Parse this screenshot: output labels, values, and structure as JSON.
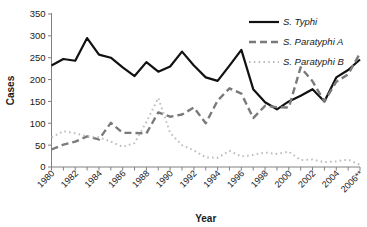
{
  "chart_data": {
    "type": "line",
    "title": "",
    "xlabel": "Year",
    "ylabel": "Cases",
    "ylim": [
      0,
      350
    ],
    "yticks": [
      0,
      50,
      100,
      150,
      200,
      250,
      300,
      350
    ],
    "grid": false,
    "legend_position": "top-right",
    "x": [
      "1980",
      "1981",
      "1982",
      "1983",
      "1984",
      "1985",
      "1986",
      "1987",
      "1988",
      "1989",
      "1990",
      "1991",
      "1992",
      "1993",
      "1994",
      "1995",
      "1996",
      "1997",
      "1998",
      "1999",
      "2000",
      "2001",
      "2002",
      "2003",
      "2004",
      "2005",
      "2006**"
    ],
    "xtick_labels": [
      "1980",
      "1982",
      "1984",
      "1986",
      "1988",
      "1990",
      "1992",
      "1994",
      "1996",
      "1998",
      "2000",
      "2002",
      "2004",
      "2006**"
    ],
    "series": [
      {
        "name": "S. Typhi",
        "style": "solid",
        "color": "#111111",
        "values": [
          232,
          247,
          243,
          295,
          257,
          250,
          228,
          208,
          240,
          218,
          230,
          264,
          232,
          205,
          197,
          232,
          268,
          178,
          148,
          132,
          150,
          163,
          178,
          150,
          205,
          222,
          246
        ]
      },
      {
        "name": "S. Paratyphi A",
        "style": "dashed",
        "color": "#7a7a7a",
        "values": [
          40,
          51,
          58,
          70,
          63,
          101,
          78,
          78,
          77,
          125,
          115,
          120,
          136,
          100,
          152,
          180,
          168,
          112,
          140,
          137,
          136,
          228,
          196,
          150,
          195,
          212,
          260
        ]
      },
      {
        "name": "S. Paratyphi B",
        "style": "dotted",
        "color": "#bdbdbd",
        "values": [
          68,
          82,
          77,
          70,
          68,
          58,
          46,
          55,
          103,
          158,
          78,
          50,
          38,
          22,
          21,
          37,
          24,
          28,
          33,
          30,
          35,
          16,
          17,
          11,
          13,
          17,
          5
        ]
      }
    ]
  },
  "legend": {
    "items": [
      {
        "label": "S. Typhi"
      },
      {
        "label": "S. Paratyphi A"
      },
      {
        "label": "S. Paratyphi B"
      }
    ]
  },
  "axes": {
    "y_label": "Cases",
    "x_label": "Year"
  }
}
